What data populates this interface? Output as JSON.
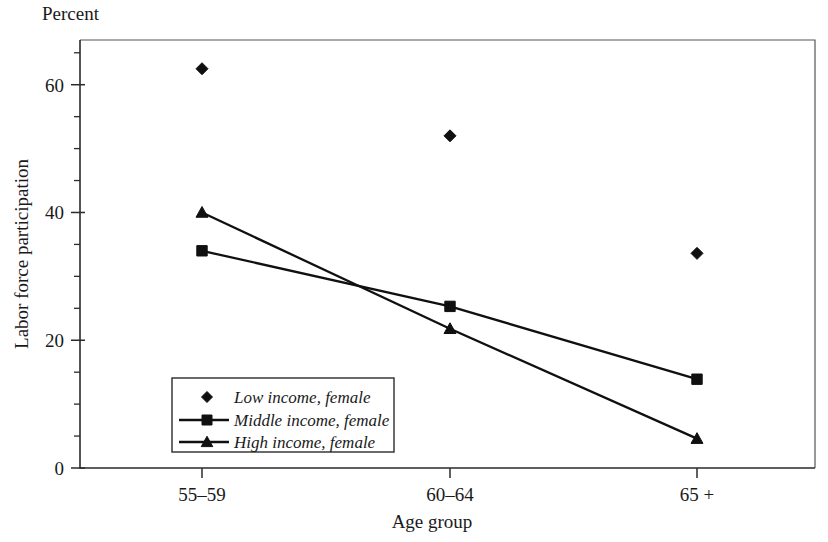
{
  "chart_data": {
    "type": "line",
    "title": "",
    "subtitle": "",
    "corner_label": "Percent",
    "xlabel": "Age group",
    "ylabel": "Labor force participation",
    "categories": [
      "55–59",
      "60–64",
      "65 +"
    ],
    "ylim": [
      0,
      67
    ],
    "yticks": [
      0,
      20,
      40,
      60
    ],
    "ytick_labels": [
      "0",
      "20",
      "40",
      "60"
    ],
    "yminor_step": 5,
    "grid": false,
    "legend_position": "inside-lower-left",
    "series": [
      {
        "name": "Low income, female",
        "marker": "diamond",
        "line": false,
        "values": [
          62.5,
          52.0,
          33.6
        ]
      },
      {
        "name": "Middle income, female",
        "marker": "square",
        "line": true,
        "values": [
          34.0,
          25.3,
          13.9
        ]
      },
      {
        "name": "High income, female",
        "marker": "triangle",
        "line": true,
        "values": [
          40.0,
          21.8,
          4.6
        ]
      }
    ],
    "colors": {
      "series": "#101010",
      "axis": "#2b2b2b",
      "frame": "#555555",
      "background": "#ffffff"
    }
  }
}
